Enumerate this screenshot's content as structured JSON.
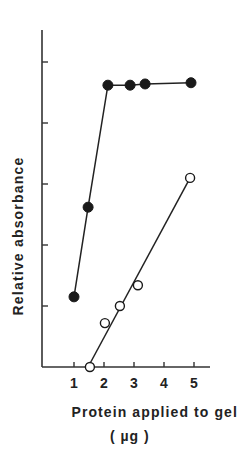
{
  "chart_data": {
    "type": "line",
    "title": "",
    "xlabel": "Protein applied to gel",
    "xunit": "( µg )",
    "ylabel": "Relative absorbance",
    "xlim": [
      0.5,
      5.5
    ],
    "ylim": [
      0,
      5.5
    ],
    "xticks": [
      1,
      2,
      3,
      4,
      5
    ],
    "yticks": [
      1,
      2,
      3,
      4,
      5
    ],
    "ytick_labels_shown": false,
    "grid": false,
    "legend": null,
    "series": [
      {
        "name": "filled circles",
        "marker": "filled-circle",
        "color": "#1a1a1a",
        "x": [
          1.0,
          1.47,
          2.13,
          2.87,
          3.37,
          4.9
        ],
        "y": [
          1.15,
          2.62,
          4.62,
          4.62,
          4.64,
          4.66
        ]
      },
      {
        "name": "open circles",
        "marker": "open-circle",
        "color": "#1a1a1a",
        "x": [
          1.53,
          2.03,
          2.53,
          3.13,
          4.87
        ],
        "y": [
          0.0,
          0.72,
          1.0,
          1.34,
          3.1
        ],
        "fit_line": {
          "x": [
            1.47,
            4.87
          ],
          "y": [
            0.0,
            3.1
          ]
        }
      }
    ]
  },
  "labels": {
    "ylabel": "Relative absorbance",
    "xlabel": "Protein applied to gel",
    "xunit": "( µg )"
  }
}
